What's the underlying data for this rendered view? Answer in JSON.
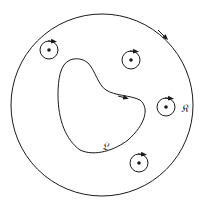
{
  "diagram": {
    "labels": {
      "outer_curve": "𝔎",
      "inner_curve": "𝔏"
    },
    "stroke_color": "#1a1a1a",
    "background": "#ffffff",
    "small_circle_count": 4
  }
}
